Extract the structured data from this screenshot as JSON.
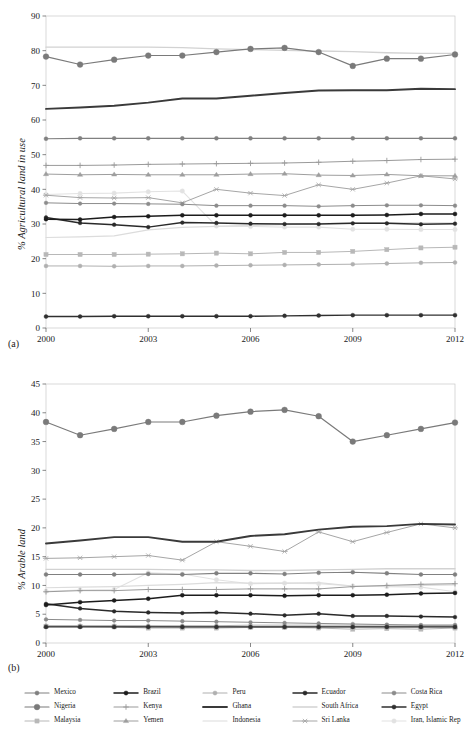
{
  "figure": {
    "panel_a_label": "(a)",
    "panel_b_label": "(b)"
  },
  "legend": {
    "position": "bottom",
    "columns": 5,
    "items": [
      {
        "label": "Mexico",
        "color": "#808080",
        "marker": "circle",
        "lw": 1.1,
        "ms": 3.2
      },
      {
        "label": "Brazil",
        "color": "#1c1c1c",
        "marker": "circle",
        "lw": 1.5,
        "ms": 3.2
      },
      {
        "label": "Peru",
        "color": "#b0b0b0",
        "marker": "circle",
        "lw": 1.0,
        "ms": 3.2
      },
      {
        "label": "Ecuador",
        "color": "#2a2a2a",
        "marker": "circle",
        "lw": 1.5,
        "ms": 3.0
      },
      {
        "label": "Costa Rica",
        "color": "#8c8c8c",
        "marker": "circle",
        "lw": 1.0,
        "ms": 3.0
      },
      {
        "label": "Nigeria",
        "color": "#7a7a7a",
        "marker": "circle",
        "lw": 1.2,
        "ms": 4.6
      },
      {
        "label": "Kenya",
        "color": "#9a9a9a",
        "marker": "plus",
        "lw": 1.0,
        "ms": 3.6
      },
      {
        "label": "Ghana",
        "color": "#3a3a3a",
        "marker": "none",
        "lw": 1.9,
        "ms": 0
      },
      {
        "label": "South Africa",
        "color": "#d2d2d2",
        "marker": "none",
        "lw": 1.3,
        "ms": 0
      },
      {
        "label": "Egypt",
        "color": "#303030",
        "marker": "circle",
        "lw": 1.4,
        "ms": 3.2
      },
      {
        "label": "Malaysia",
        "color": "#b8b8b8",
        "marker": "square",
        "lw": 1.0,
        "ms": 4.2
      },
      {
        "label": "Yemen",
        "color": "#9e9e9e",
        "marker": "triangle",
        "lw": 1.0,
        "ms": 4.0
      },
      {
        "label": "Indonesia",
        "color": "#dcdcdc",
        "marker": "none",
        "lw": 1.2,
        "ms": 0
      },
      {
        "label": "Sri Lanka",
        "color": "#a6a6a6",
        "marker": "star",
        "lw": 1.0,
        "ms": 4.0
      },
      {
        "label": "Iran, Islamic Rep",
        "color": "#e2e2e2",
        "marker": "circle",
        "lw": 1.1,
        "ms": 3.6
      }
    ]
  },
  "chart_data": [
    {
      "id": "panel-a",
      "type": "line",
      "title": "",
      "xlabel": "",
      "ylabel": "% Agricultural land in use",
      "x": [
        2000,
        2001,
        2002,
        2003,
        2004,
        2005,
        2006,
        2007,
        2008,
        2009,
        2010,
        2011,
        2012
      ],
      "xticks": [
        2000,
        2003,
        2006,
        2009,
        2012
      ],
      "xlim": [
        2000,
        2012
      ],
      "ylim": [
        0,
        90
      ],
      "yticks": [
        0,
        10,
        20,
        30,
        40,
        50,
        60,
        70,
        80,
        90
      ],
      "grid": false,
      "series": [
        {
          "name": "Mexico",
          "values": [
            54.6,
            54.7,
            54.7,
            54.7,
            54.7,
            54.7,
            54.7,
            54.7,
            54.7,
            54.7,
            54.7,
            54.7,
            54.7
          ]
        },
        {
          "name": "Brazil",
          "values": [
            31.4,
            31.3,
            32.0,
            32.2,
            32.5,
            32.5,
            32.5,
            32.5,
            32.5,
            32.5,
            32.6,
            32.9,
            32.9
          ]
        },
        {
          "name": "Peru",
          "values": [
            17.9,
            17.9,
            17.8,
            17.9,
            17.9,
            18.0,
            18.1,
            18.2,
            18.3,
            18.4,
            18.6,
            18.8,
            18.9
          ]
        },
        {
          "name": "Ecuador",
          "values": [
            31.9,
            30.3,
            29.8,
            29.1,
            30.4,
            30.3,
            30.1,
            30.0,
            30.0,
            30.2,
            30.2,
            29.9,
            30.1
          ]
        },
        {
          "name": "Costa Rica",
          "values": [
            36.1,
            35.9,
            35.9,
            35.8,
            35.7,
            35.3,
            35.3,
            35.3,
            35.1,
            35.3,
            35.4,
            35.4,
            35.3
          ]
        },
        {
          "name": "Nigeria",
          "values": [
            78.3,
            76.0,
            77.4,
            78.6,
            78.6,
            79.6,
            80.5,
            80.8,
            79.6,
            75.6,
            77.7,
            77.7,
            78.9
          ]
        },
        {
          "name": "Kenya",
          "values": [
            46.9,
            46.9,
            47.0,
            47.2,
            47.3,
            47.4,
            47.5,
            47.6,
            47.8,
            48.1,
            48.3,
            48.6,
            48.7
          ]
        },
        {
          "name": "Ghana",
          "values": [
            63.2,
            63.6,
            64.1,
            65.0,
            66.2,
            66.2,
            67.0,
            67.8,
            68.5,
            68.6,
            68.6,
            69.0,
            68.9
          ]
        },
        {
          "name": "South Africa",
          "values": [
            81.0,
            81.0,
            81.0,
            81.0,
            80.9,
            80.5,
            80.3,
            80.1,
            79.9,
            79.7,
            79.4,
            79.2,
            79.2
          ]
        },
        {
          "name": "Egypt",
          "values": [
            3.3,
            3.3,
            3.4,
            3.4,
            3.4,
            3.4,
            3.4,
            3.5,
            3.6,
            3.7,
            3.7,
            3.7,
            3.7
          ]
        },
        {
          "name": "Malaysia",
          "values": [
            21.2,
            21.2,
            21.2,
            21.3,
            21.4,
            21.6,
            21.4,
            21.8,
            21.8,
            22.1,
            22.6,
            23.1,
            23.3
          ]
        },
        {
          "name": "Yemen",
          "values": [
            44.4,
            44.2,
            44.3,
            44.2,
            44.2,
            44.2,
            44.4,
            44.5,
            44.1,
            44.0,
            44.3,
            43.9,
            43.9
          ]
        },
        {
          "name": "Indonesia",
          "values": [
            26.1,
            26.3,
            26.6,
            28.3,
            29.0,
            29.3,
            29.6,
            29.8,
            30.1,
            30.3,
            30.3,
            30.3,
            30.3
          ]
        },
        {
          "name": "Sri Lanka",
          "values": [
            38.3,
            37.6,
            37.5,
            37.6,
            36.1,
            40.0,
            38.9,
            38.2,
            41.3,
            40.0,
            41.8,
            43.9,
            43.0
          ]
        },
        {
          "name": "Iran, Islamic Rep",
          "values": [
            38.5,
            38.8,
            38.9,
            39.3,
            39.5,
            29.4,
            29.3,
            29.1,
            29.1,
            28.5,
            28.5,
            28.4,
            28.4
          ]
        }
      ]
    },
    {
      "id": "panel-b",
      "type": "line",
      "title": "",
      "xlabel": "",
      "ylabel": "% Arable land",
      "x": [
        2000,
        2001,
        2002,
        2003,
        2004,
        2005,
        2006,
        2007,
        2008,
        2009,
        2010,
        2011,
        2012
      ],
      "xticks": [
        2000,
        2003,
        2006,
        2009,
        2012
      ],
      "xlim": [
        2000,
        2012
      ],
      "ylim": [
        0,
        45
      ],
      "yticks": [
        0,
        5,
        10,
        15,
        20,
        25,
        30,
        35,
        40,
        45
      ],
      "grid": false,
      "series": [
        {
          "name": "Mexico",
          "values": [
            11.9,
            11.9,
            11.9,
            12.0,
            11.9,
            12.1,
            12.1,
            12.0,
            12.2,
            12.3,
            12.1,
            11.9,
            11.9
          ]
        },
        {
          "name": "Brazil",
          "values": [
            6.6,
            7.1,
            7.4,
            7.7,
            8.3,
            8.3,
            8.3,
            8.2,
            8.3,
            8.3,
            8.4,
            8.6,
            8.7
          ]
        },
        {
          "name": "Peru",
          "values": [
            3.0,
            3.0,
            3.0,
            3.0,
            3.0,
            3.0,
            3.1,
            3.1,
            3.1,
            3.1,
            3.1,
            3.1,
            3.1
          ]
        },
        {
          "name": "Ecuador",
          "values": [
            6.8,
            6.0,
            5.5,
            5.3,
            5.2,
            5.3,
            5.1,
            4.8,
            5.1,
            4.7,
            4.7,
            4.6,
            4.5
          ]
        },
        {
          "name": "Costa Rica",
          "values": [
            4.1,
            4.0,
            3.9,
            3.9,
            3.8,
            3.7,
            3.6,
            3.5,
            3.4,
            3.3,
            3.2,
            3.1,
            3.1
          ]
        },
        {
          "name": "Nigeria",
          "values": [
            38.4,
            36.1,
            37.2,
            38.4,
            38.4,
            39.5,
            40.2,
            40.5,
            39.4,
            35.0,
            36.1,
            37.2,
            38.3
          ]
        },
        {
          "name": "Kenya",
          "values": [
            8.9,
            9.1,
            9.1,
            9.3,
            9.3,
            9.3,
            9.4,
            9.4,
            9.4,
            9.8,
            10.0,
            10.2,
            10.3
          ]
        },
        {
          "name": "Ghana",
          "values": [
            17.3,
            17.8,
            18.4,
            18.4,
            17.6,
            17.6,
            18.6,
            18.9,
            19.7,
            20.2,
            20.3,
            20.7,
            20.6
          ]
        },
        {
          "name": "South Africa",
          "values": [
            12.8,
            12.8,
            12.8,
            12.8,
            12.7,
            12.7,
            12.6,
            12.6,
            12.7,
            12.8,
            12.9,
            12.9,
            12.9
          ]
        },
        {
          "name": "Egypt",
          "values": [
            2.8,
            2.8,
            2.8,
            2.8,
            2.8,
            2.8,
            2.8,
            2.8,
            2.8,
            2.8,
            2.8,
            2.8,
            2.8
          ]
        },
        {
          "name": "Malaysia",
          "values": [
            2.9,
            2.9,
            2.8,
            2.6,
            2.6,
            2.6,
            2.7,
            2.7,
            2.6,
            2.4,
            2.5,
            2.4,
            2.6
          ]
        },
        {
          "name": "Yemen",
          "values": [
            2.9,
            2.9,
            2.9,
            2.9,
            2.8,
            2.8,
            2.8,
            2.8,
            2.8,
            2.8,
            2.8,
            2.8,
            2.8
          ]
        },
        {
          "name": "Indonesia",
          "values": [
            9.6,
            9.7,
            9.8,
            10.0,
            10.2,
            10.5,
            10.4,
            10.4,
            10.5,
            9.9,
            9.9,
            10.0,
            10.1
          ]
        },
        {
          "name": "Sri Lanka",
          "values": [
            14.7,
            14.8,
            15.0,
            15.2,
            14.4,
            17.6,
            16.8,
            15.9,
            19.3,
            17.6,
            19.2,
            20.7,
            20.0
          ]
        },
        {
          "name": "Iran, Islamic Rep",
          "values": [
            9.0,
            9.2,
            9.3,
            12.2,
            12.0,
            11.0,
            10.3,
            10.4,
            10.3,
            9.9,
            9.8,
            9.7,
            8.9
          ]
        }
      ]
    }
  ]
}
